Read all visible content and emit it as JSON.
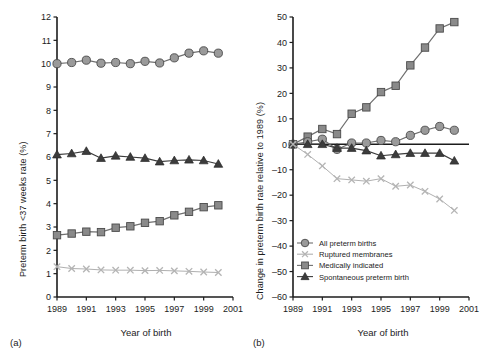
{
  "figure": {
    "panels": [
      {
        "caption": "(a)",
        "xlabel": "Year of birth",
        "ylabel": "Preterm birth <37 weeks rate (%)"
      },
      {
        "caption": "(b)",
        "xlabel": "Year of birth",
        "ylabel": "Change in preterm birth rate relative to 1989 (%)"
      }
    ],
    "legend": {
      "position": "inside-lower-left-panel-b",
      "entries": [
        {
          "label": "All preterm births",
          "marker": "circle",
          "color": "#9a9a9a"
        },
        {
          "label": "Ruptured membranes",
          "marker": "x",
          "color": "#b4b4b4"
        },
        {
          "label": "Medically indicated",
          "marker": "square",
          "color": "#8a8a8a"
        },
        {
          "label": "Spontaneous preterm birth",
          "marker": "triangle",
          "color": "#3c3c3c"
        }
      ]
    }
  },
  "chart_data": [
    {
      "type": "line",
      "panel": "a",
      "title": "",
      "xlabel": "Year of birth",
      "ylabel": "Preterm birth <37 weeks rate (%)",
      "x": [
        1989,
        1990,
        1991,
        1992,
        1993,
        1994,
        1995,
        1996,
        1997,
        1998,
        1999,
        2000
      ],
      "xlim": [
        1989,
        2001
      ],
      "xticks": [
        1989,
        1991,
        1993,
        1995,
        1997,
        1999,
        2001
      ],
      "ylim": [
        0,
        12
      ],
      "yticks": [
        0,
        1,
        2,
        3,
        4,
        5,
        6,
        7,
        8,
        9,
        10,
        11,
        12
      ],
      "grid": false,
      "legend": "none",
      "series": [
        {
          "name": "All preterm births",
          "marker": "circle",
          "color": "#9a9a9a",
          "values": [
            10.0,
            10.05,
            10.15,
            10.02,
            10.05,
            10.0,
            10.1,
            10.03,
            10.25,
            10.45,
            10.55,
            10.45
          ]
        },
        {
          "name": "Spontaneous preterm birth",
          "marker": "triangle",
          "color": "#3c3c3c",
          "values": [
            6.1,
            6.15,
            6.25,
            5.95,
            6.05,
            6.0,
            5.95,
            5.8,
            5.85,
            5.88,
            5.85,
            5.7
          ]
        },
        {
          "name": "Medically indicated",
          "marker": "square",
          "color": "#8a8a8a",
          "values": [
            2.65,
            2.72,
            2.8,
            2.78,
            2.97,
            3.03,
            3.18,
            3.25,
            3.5,
            3.65,
            3.85,
            3.93
          ]
        },
        {
          "name": "Ruptured membranes",
          "marker": "x",
          "color": "#b4b4b4",
          "values": [
            1.3,
            1.22,
            1.2,
            1.16,
            1.15,
            1.15,
            1.13,
            1.14,
            1.12,
            1.1,
            1.07,
            1.05
          ]
        }
      ]
    },
    {
      "type": "line",
      "panel": "b",
      "title": "",
      "xlabel": "Year of birth",
      "ylabel": "Change in preterm birth rate relative to 1989 (%)",
      "x": [
        1989,
        1990,
        1991,
        1992,
        1993,
        1994,
        1995,
        1996,
        1997,
        1998,
        1999,
        2000
      ],
      "xlim": [
        1989,
        2001
      ],
      "xticks": [
        1989,
        1991,
        1993,
        1995,
        1997,
        1999,
        2001
      ],
      "ylim": [
        -60,
        50
      ],
      "yticks": [
        -60,
        -50,
        -40,
        -30,
        -20,
        -10,
        0,
        10,
        20,
        30,
        40,
        50
      ],
      "grid": false,
      "reference_line": 0,
      "legend": "lower-left",
      "series": [
        {
          "name": "Medically indicated",
          "marker": "square",
          "color": "#8a8a8a",
          "values": [
            0,
            3,
            6,
            4,
            12,
            14.5,
            20.5,
            23,
            31,
            38,
            45.5,
            48
          ]
        },
        {
          "name": "All preterm births",
          "marker": "circle",
          "color": "#9a9a9a",
          "values": [
            0,
            1,
            2,
            -2,
            0.5,
            0.5,
            1.5,
            1,
            3.5,
            5.5,
            7,
            5.5
          ]
        },
        {
          "name": "Spontaneous preterm birth",
          "marker": "triangle",
          "color": "#3c3c3c",
          "values": [
            0,
            0,
            0,
            -1.5,
            -1.5,
            -2.5,
            -4.5,
            -4,
            -3.5,
            -3.5,
            -3.5,
            -6.5
          ]
        },
        {
          "name": "Ruptured membranes",
          "marker": "x",
          "color": "#b4b4b4",
          "values": [
            0,
            -4,
            -8.5,
            -13.5,
            -14,
            -14.5,
            -13.5,
            -16.5,
            -16,
            -18.5,
            -21.5,
            -26
          ]
        }
      ]
    }
  ]
}
